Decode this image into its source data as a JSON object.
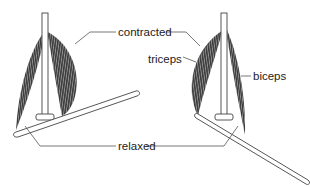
{
  "diagram": {
    "labels": {
      "contracted": "contracted",
      "relaxed": "relaxed",
      "triceps": "triceps",
      "biceps": "biceps"
    },
    "panels": [
      {
        "position": "left",
        "state": "arm raised (biceps contracted, triceps relaxed)"
      },
      {
        "position": "right",
        "state": "arm lowered (triceps contracted, biceps relaxed)"
      }
    ],
    "colors": {
      "muscle": "#3a3a3a",
      "muscle_stripe": "#9a9a9a",
      "bone_fill": "#ffffff",
      "bone_stroke": "#444444",
      "leader_line": "#555555",
      "text": "#222222"
    }
  }
}
